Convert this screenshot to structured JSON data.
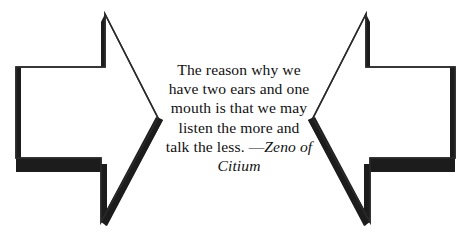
{
  "graphic": {
    "title": "Two converging arrows framing a quotation",
    "background_color": "#ffffff",
    "ink_color": "#1a1a1a",
    "outline_color": "#2b2b2b"
  },
  "quote": {
    "lines": [
      "The reason why we",
      "have two ears and one",
      "mouth is that we may",
      "listen the more and"
    ],
    "last_line_text": "talk the less. ",
    "attribution_dash": "—",
    "attribution_line_1": "Zeno of",
    "attribution_line_2": "Citium",
    "full_text": "The reason why we have two ears and one mouth is that we may listen the more and talk the less. —Zeno of Citium"
  },
  "arrows": {
    "left": {
      "name": "right-pointing-arrow",
      "direction": "right"
    },
    "right": {
      "name": "left-pointing-arrow",
      "direction": "left"
    }
  }
}
